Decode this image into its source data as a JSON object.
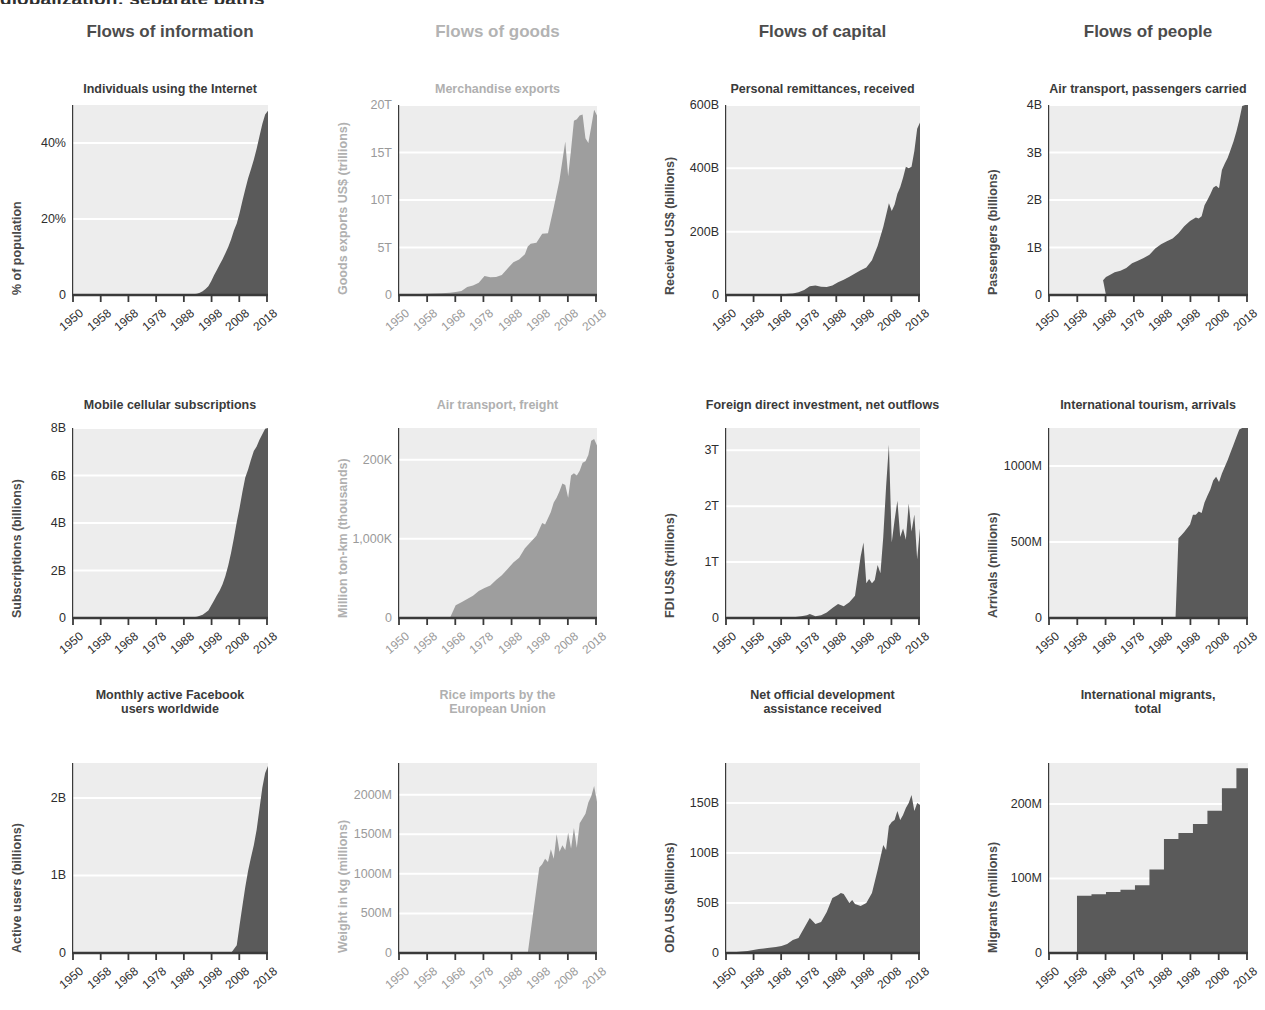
{
  "headline": "globalization: separate paths",
  "palette": {
    "dark_fill": "#5a5a5a",
    "pale_fill": "#9e9e9e",
    "plot_bg": "#ededed",
    "grid": "#ffffff",
    "axis": "#3a3a3a",
    "dark_text": "#3a3a3a",
    "pale_text": "#b0b0b0"
  },
  "columns": [
    {
      "label": "Flows of information",
      "tone": "dark"
    },
    {
      "label": "Flows of goods",
      "tone": "pale"
    },
    {
      "label": "Flows of capital",
      "tone": "dark"
    },
    {
      "label": "Flows of people",
      "tone": "dark"
    }
  ],
  "xticks": [
    "1950",
    "1958",
    "1968",
    "1978",
    "1988",
    "1998",
    "2008",
    "2018"
  ],
  "chart_data": [
    {
      "id": "individuals-using-the-internet",
      "type": "area",
      "tone": "dark",
      "row": 0,
      "col": 0,
      "title": "Individuals using the Internet",
      "ylabel": "% of population",
      "xlabel": "",
      "ytick_labels": [
        "0",
        "20%",
        "40%"
      ],
      "ytick_values": [
        0,
        20,
        40
      ],
      "ylim": [
        0,
        50
      ],
      "xlim": [
        1950,
        2019
      ],
      "grid": true,
      "x": [
        1950,
        1960,
        1970,
        1980,
        1985,
        1990,
        1992,
        1994,
        1995,
        1996,
        1997,
        1998,
        1999,
        2000,
        2001,
        2002,
        2003,
        2004,
        2005,
        2006,
        2007,
        2008,
        2009,
        2010,
        2011,
        2012,
        2013,
        2014,
        2015,
        2016,
        2017,
        2018,
        2019
      ],
      "values": [
        0,
        0,
        0,
        0,
        0,
        0,
        0.1,
        0.3,
        0.6,
        1.0,
        1.6,
        2.3,
        3.6,
        5.2,
        6.6,
        8.0,
        9.4,
        11.0,
        12.6,
        14.6,
        17.0,
        18.8,
        21.6,
        24.8,
        27.8,
        30.7,
        33.1,
        35.6,
        38.5,
        41.8,
        45.0,
        47.5,
        48.5
      ]
    },
    {
      "id": "merchandise-exports",
      "type": "area",
      "tone": "pale",
      "row": 0,
      "col": 1,
      "title": "Merchandise exports",
      "ylabel": "Goods exports US$ (trillions)",
      "xlabel": "",
      "ytick_labels": [
        "0",
        "5T",
        "10T",
        "15T",
        "20T"
      ],
      "ytick_values": [
        0,
        5,
        10,
        15,
        20
      ],
      "ylim": [
        0,
        20
      ],
      "xlim": [
        1950,
        2019
      ],
      "grid": true,
      "x": [
        1950,
        1955,
        1960,
        1962,
        1965,
        1968,
        1970,
        1972,
        1974,
        1976,
        1978,
        1980,
        1982,
        1984,
        1986,
        1988,
        1990,
        1992,
        1994,
        1995,
        1996,
        1998,
        2000,
        2002,
        2004,
        2006,
        2008,
        2009,
        2010,
        2011,
        2012,
        2013,
        2014,
        2015,
        2016,
        2017,
        2018,
        2019
      ],
      "values": [
        0.06,
        0.09,
        0.13,
        0.15,
        0.19,
        0.24,
        0.31,
        0.42,
        0.84,
        1.0,
        1.3,
        2.0,
        1.88,
        1.9,
        2.1,
        2.8,
        3.45,
        3.75,
        4.3,
        5.1,
        5.4,
        5.5,
        6.45,
        6.5,
        9.2,
        12.1,
        16.15,
        12.5,
        15.3,
        18.35,
        18.5,
        18.9,
        19.0,
        16.5,
        16.0,
        17.7,
        19.5,
        18.9
      ]
    },
    {
      "id": "personal-remittances-received",
      "type": "area",
      "tone": "dark",
      "row": 0,
      "col": 2,
      "title": "Personal remittances, received",
      "ylabel": "Received US$ (billions)",
      "xlabel": "",
      "ytick_labels": [
        "0",
        "200B",
        "400B",
        "600B"
      ],
      "ytick_values": [
        0,
        200,
        400,
        600
      ],
      "ylim": [
        0,
        600
      ],
      "xlim": [
        1950,
        2019
      ],
      "grid": true,
      "x": [
        1950,
        1960,
        1970,
        1974,
        1976,
        1978,
        1980,
        1982,
        1984,
        1986,
        1988,
        1990,
        1992,
        1994,
        1996,
        1998,
        2000,
        2002,
        2004,
        2006,
        2008,
        2009,
        2010,
        2011,
        2012,
        2013,
        2014,
        2015,
        2016,
        2017,
        2018,
        2019
      ],
      "values": [
        0,
        0,
        2,
        5,
        9,
        16,
        28,
        30,
        26,
        25,
        30,
        40,
        48,
        58,
        68,
        78,
        87,
        110,
        155,
        215,
        290,
        265,
        285,
        320,
        340,
        370,
        405,
        400,
        405,
        455,
        525,
        545
      ]
    },
    {
      "id": "air-transport-passengers-carried",
      "type": "area",
      "tone": "dark",
      "row": 0,
      "col": 3,
      "title": "Air transport, passengers carried",
      "ylabel": "Passengers (billions)",
      "xlabel": "",
      "ytick_labels": [
        "0",
        "1B",
        "2B",
        "3B",
        "4B"
      ],
      "ytick_values": [
        0,
        1,
        2,
        3,
        4
      ],
      "ylim": [
        0,
        4
      ],
      "xlim": [
        1950,
        2019
      ],
      "grid": true,
      "x": [
        1950,
        1960,
        1965,
        1970,
        1969,
        1970,
        1971,
        1973,
        1975,
        1977,
        1979,
        1981,
        1983,
        1985,
        1987,
        1989,
        1991,
        1993,
        1995,
        1997,
        1999,
        2001,
        2002,
        2003,
        2004,
        2005,
        2006,
        2007,
        2008,
        2009,
        2010,
        2011,
        2012,
        2013,
        2014,
        2015,
        2016,
        2017,
        2018,
        2019
      ],
      "values": [
        0,
        0,
        0,
        0,
        0.31,
        0.38,
        0.41,
        0.48,
        0.51,
        0.57,
        0.67,
        0.72,
        0.78,
        0.85,
        0.98,
        1.07,
        1.13,
        1.19,
        1.3,
        1.45,
        1.56,
        1.63,
        1.61,
        1.66,
        1.89,
        2.0,
        2.12,
        2.26,
        2.3,
        2.25,
        2.63,
        2.77,
        2.89,
        3.06,
        3.23,
        3.44,
        3.69,
        3.98,
        4.23,
        4.4
      ]
    },
    {
      "id": "mobile-cellular-subscriptions",
      "type": "area",
      "tone": "dark",
      "row": 1,
      "col": 0,
      "title": "Mobile cellular subscriptions",
      "ylabel": "Subscriptions (billions)",
      "xlabel": "",
      "ytick_labels": [
        "0",
        "2B",
        "4B",
        "6B",
        "8B"
      ],
      "ytick_values": [
        0,
        2,
        4,
        6,
        8
      ],
      "ylim": [
        0,
        8
      ],
      "xlim": [
        1950,
        2019
      ],
      "grid": true,
      "x": [
        1950,
        1970,
        1980,
        1985,
        1990,
        1992,
        1994,
        1996,
        1998,
        2000,
        2001,
        2002,
        2003,
        2004,
        2005,
        2006,
        2007,
        2008,
        2009,
        2010,
        2011,
        2012,
        2013,
        2014,
        2015,
        2016,
        2017,
        2018,
        2019
      ],
      "values": [
        0,
        0,
        0,
        0,
        0.01,
        0.02,
        0.05,
        0.14,
        0.32,
        0.74,
        0.96,
        1.16,
        1.42,
        1.77,
        2.21,
        2.75,
        3.37,
        4.04,
        4.64,
        5.32,
        5.92,
        6.25,
        6.66,
        7.03,
        7.22,
        7.51,
        7.74,
        7.97,
        8.0
      ]
    },
    {
      "id": "air-transport-freight",
      "type": "area",
      "tone": "pale",
      "row": 1,
      "col": 1,
      "title": "Air transport, freight",
      "ylabel": "Million ton-km (thousands)",
      "xlabel": "",
      "ytick_labels": [
        "0",
        "1,000K",
        "200K"
      ],
      "ytick_values": [
        0,
        100,
        200
      ],
      "ylim": [
        0,
        240
      ],
      "xlim": [
        1950,
        2019
      ],
      "grid": true,
      "x": [
        1950,
        1960,
        1968,
        1970,
        1972,
        1974,
        1976,
        1978,
        1980,
        1982,
        1984,
        1986,
        1988,
        1990,
        1992,
        1994,
        1996,
        1998,
        2000,
        2001,
        2002,
        2003,
        2004,
        2005,
        2006,
        2007,
        2008,
        2009,
        2010,
        2011,
        2012,
        2013,
        2014,
        2015,
        2016,
        2017,
        2018,
        2019
      ],
      "values": [
        0,
        0,
        0,
        16,
        20,
        24,
        28,
        34,
        38,
        41,
        48,
        54,
        62,
        70,
        76,
        88,
        96,
        104,
        120,
        118,
        126,
        134,
        146,
        152,
        160,
        170,
        168,
        152,
        180,
        183,
        180,
        186,
        196,
        198,
        206,
        224,
        226,
        218
      ]
    },
    {
      "id": "foreign-direct-investment-net-outflows",
      "type": "area",
      "tone": "dark",
      "row": 1,
      "col": 2,
      "title": "Foreign direct investment, net outflows",
      "ylabel": "FDI US$ (trillions)",
      "xlabel": "",
      "ytick_labels": [
        "0",
        "1T",
        "2T",
        "3T"
      ],
      "ytick_values": [
        0,
        1,
        2,
        3
      ],
      "ylim": [
        0,
        3.4
      ],
      "xlim": [
        1950,
        2019
      ],
      "grid": true,
      "x": [
        1950,
        1965,
        1970,
        1975,
        1977,
        1979,
        1980,
        1982,
        1984,
        1986,
        1988,
        1990,
        1992,
        1994,
        1996,
        1998,
        1999,
        2000,
        2001,
        2002,
        2003,
        2004,
        2005,
        2006,
        2007,
        2008,
        2009,
        2010,
        2011,
        2012,
        2013,
        2014,
        2015,
        2016,
        2017,
        2018,
        2019
      ],
      "values": [
        0,
        0,
        0.01,
        0.02,
        0.03,
        0.05,
        0.07,
        0.03,
        0.05,
        0.1,
        0.18,
        0.25,
        0.21,
        0.28,
        0.4,
        1.1,
        1.35,
        0.62,
        0.7,
        0.62,
        0.68,
        0.95,
        0.8,
        1.45,
        2.35,
        3.1,
        1.35,
        1.75,
        2.1,
        1.45,
        1.6,
        1.4,
        2.05,
        1.55,
        1.85,
        1.05,
        1.6
      ]
    },
    {
      "id": "international-tourism-arrivals",
      "type": "area",
      "tone": "dark",
      "row": 1,
      "col": 3,
      "title": "International tourism, arrivals",
      "ylabel": "Arrivals (millions)",
      "xlabel": "",
      "ytick_labels": [
        "0",
        "500M",
        "1000M"
      ],
      "ytick_values": [
        0,
        500,
        1000
      ],
      "ylim": [
        0,
        1250
      ],
      "xlim": [
        1950,
        2019
      ],
      "grid": true,
      "x": [
        1950,
        1980,
        1990,
        1994,
        1995,
        1996,
        1997,
        1998,
        1999,
        2000,
        2001,
        2002,
        2003,
        2004,
        2005,
        2006,
        2007,
        2008,
        2009,
        2010,
        2011,
        2012,
        2013,
        2014,
        2015,
        2016,
        2017,
        2018,
        2019
      ],
      "values": [
        0,
        0,
        0,
        0,
        525,
        545,
        565,
        590,
        615,
        680,
        680,
        700,
        690,
        760,
        805,
        845,
        905,
        930,
        895,
        950,
        995,
        1040,
        1090,
        1140,
        1190,
        1240,
        1330,
        1400,
        1460
      ]
    },
    {
      "id": "monthly-active-facebook-users-worldwide",
      "type": "area",
      "tone": "dark",
      "row": 2,
      "col": 0,
      "title": "Monthly active Facebook\nusers worldwide",
      "ylabel": "Active users (billions)",
      "xlabel": "",
      "ytick_labels": [
        "0",
        "1B",
        "2B"
      ],
      "ytick_values": [
        0,
        1,
        2
      ],
      "ylim": [
        0,
        2.45
      ],
      "xlim": [
        1950,
        2019
      ],
      "grid": true,
      "x": [
        1950,
        2004,
        2006,
        2008,
        2009,
        2010,
        2011,
        2012,
        2013,
        2014,
        2015,
        2016,
        2017,
        2018,
        2019
      ],
      "values": [
        0,
        0,
        0,
        0.1,
        0.36,
        0.61,
        0.85,
        1.06,
        1.23,
        1.39,
        1.59,
        1.86,
        2.13,
        2.32,
        2.41
      ]
    },
    {
      "id": "rice-imports-by-the-european-union",
      "type": "area",
      "tone": "pale",
      "row": 2,
      "col": 1,
      "title": "Rice imports by the\nEuropean Union",
      "ylabel": "Weight in kg (millions)",
      "xlabel": "",
      "ytick_labels": [
        "0",
        "500M",
        "1000M",
        "1500M",
        "2000M"
      ],
      "ytick_values": [
        0,
        500,
        1000,
        1500,
        2000
      ],
      "ylim": [
        0,
        2400
      ],
      "xlim": [
        1950,
        2019
      ],
      "grid": true,
      "x": [
        1950,
        1995,
        1999,
        2000,
        2001,
        2002,
        2003,
        2004,
        2005,
        2006,
        2007,
        2008,
        2009,
        2010,
        2011,
        2012,
        2013,
        2014,
        2015,
        2016,
        2017,
        2018,
        2019
      ],
      "values": [
        0,
        0,
        1080,
        1120,
        1190,
        1150,
        1310,
        1190,
        1500,
        1280,
        1360,
        1300,
        1520,
        1320,
        1580,
        1330,
        1640,
        1700,
        1760,
        1900,
        1980,
        2110,
        1910
      ]
    },
    {
      "id": "net-official-development-assistance-received",
      "type": "area",
      "tone": "dark",
      "row": 2,
      "col": 2,
      "title": "Net official development\nassistance received",
      "ylabel": "ODA US$ (billions)",
      "xlabel": "",
      "ytick_labels": [
        "0",
        "50B",
        "100B",
        "150B"
      ],
      "ytick_values": [
        0,
        50,
        100,
        150
      ],
      "ylim": [
        0,
        190
      ],
      "xlim": [
        1950,
        2019
      ],
      "grid": true,
      "x": [
        1950,
        1958,
        1960,
        1962,
        1965,
        1968,
        1970,
        1972,
        1974,
        1976,
        1978,
        1980,
        1982,
        1984,
        1986,
        1988,
        1990,
        1991,
        1992,
        1994,
        1995,
        1996,
        1998,
        2000,
        2002,
        2004,
        2006,
        2007,
        2008,
        2009,
        2010,
        2011,
        2012,
        2013,
        2014,
        2015,
        2016,
        2017,
        2018,
        2019
      ],
      "values": [
        0,
        2,
        3,
        4,
        5,
        6,
        7,
        9,
        13,
        15,
        25,
        35,
        29,
        31,
        41,
        55,
        58,
        60,
        59,
        50,
        53,
        49,
        47,
        50,
        60,
        83,
        108,
        103,
        127,
        131,
        133,
        142,
        133,
        138,
        145,
        150,
        158,
        142,
        150,
        148
      ]
    },
    {
      "id": "international-migrants-total",
      "type": "step",
      "tone": "dark",
      "row": 2,
      "col": 3,
      "title": "International migrants,\ntotal",
      "ylabel": "Migrants (millions)",
      "xlabel": "",
      "ytick_labels": [
        "0",
        "100M",
        "200M"
      ],
      "ytick_values": [
        0,
        100,
        200
      ],
      "ylim": [
        0,
        255
      ],
      "xlim": [
        1950,
        2019
      ],
      "grid": true,
      "x": [
        1950,
        1960,
        1965,
        1970,
        1975,
        1980,
        1985,
        1990,
        1995,
        2000,
        2005,
        2010,
        2015,
        2019
      ],
      "values": [
        0,
        77,
        79,
        82,
        85,
        91,
        112,
        153,
        161,
        173,
        191,
        221,
        248,
        252
      ]
    }
  ]
}
